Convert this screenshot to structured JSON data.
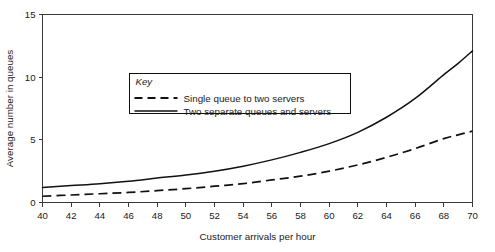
{
  "chart_data": {
    "type": "line",
    "title": "",
    "xlabel": "Customer arrivals per hour",
    "ylabel": "Average number in queues",
    "xlim": [
      40,
      70
    ],
    "ylim": [
      0,
      15
    ],
    "xticks": [
      40,
      42,
      44,
      46,
      48,
      50,
      52,
      54,
      56,
      58,
      60,
      62,
      64,
      66,
      68,
      70
    ],
    "yticks": [
      0,
      5,
      10,
      15
    ],
    "xtick_labels": [
      "40",
      "42",
      "44",
      "46",
      "48",
      "50",
      "52",
      "54",
      "56",
      "58",
      "60",
      "62",
      "64",
      "66",
      "68",
      "70"
    ],
    "ytick_labels": [
      "0",
      "5",
      "10",
      "15"
    ],
    "grid": false,
    "legend_position": "upper-left-inside",
    "legend_title": "Key",
    "x": [
      40,
      42,
      44,
      46,
      48,
      50,
      52,
      54,
      56,
      58,
      60,
      62,
      64,
      66,
      68,
      69,
      70
    ],
    "series": [
      {
        "name": "Single queue to two servers",
        "style": "dashed",
        "color": "#111111",
        "values": [
          0.5,
          0.6,
          0.7,
          0.8,
          0.95,
          1.1,
          1.3,
          1.5,
          1.8,
          2.1,
          2.5,
          3.0,
          3.6,
          4.3,
          5.1,
          5.4,
          5.7
        ]
      },
      {
        "name": "Two separate queues and servers",
        "style": "solid",
        "color": "#111111",
        "values": [
          1.2,
          1.35,
          1.5,
          1.7,
          1.95,
          2.2,
          2.5,
          2.9,
          3.4,
          4.0,
          4.7,
          5.6,
          6.8,
          8.3,
          10.2,
          11.1,
          12.1
        ]
      }
    ]
  },
  "legend": {
    "title": "Key",
    "entries": [
      {
        "label": "Single queue to two servers",
        "style": "dashed"
      },
      {
        "label": "Two separate queues and servers",
        "style": "solid"
      }
    ]
  },
  "axes": {
    "x_title": "Customer arrivals per hour",
    "y_title": "Average number in queues"
  }
}
